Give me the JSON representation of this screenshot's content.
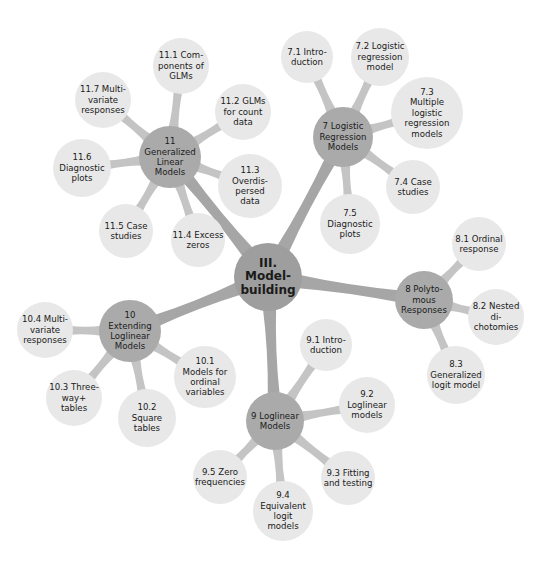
{
  "colors": {
    "background": "#ffffff",
    "root_fill": "#9e9e9e",
    "branch_fill": "#aaaaaa",
    "connector_root": "#a6a6a6",
    "connector_branch": "#c4c4c4",
    "leaf_fill": "#e8e8e8",
    "text": "#1a1a1a"
  },
  "root": {
    "id": "root",
    "label": "III.\nModel-\nbuilding",
    "x": 268,
    "y": 277,
    "r": 34
  },
  "branches": [
    {
      "id": "ch11",
      "label": "11\nGeneralized\nLinear\nModels",
      "x": 170,
      "y": 157,
      "r": 31,
      "children": [
        {
          "id": "s11_1",
          "label": "11.1 Com-\nponents of\nGLMs",
          "x": 181,
          "y": 66,
          "r": 28
        },
        {
          "id": "s11_2",
          "label": "11.2 GLMs\nfor count\ndata",
          "x": 243,
          "y": 112,
          "r": 28
        },
        {
          "id": "s11_3",
          "label": "11.3\nOverdis-\npersed\ndata",
          "x": 250,
          "y": 186,
          "r": 32
        },
        {
          "id": "s11_4",
          "label": "11.4 Excess\nzeros",
          "x": 198,
          "y": 240,
          "r": 27
        },
        {
          "id": "s11_5",
          "label": "11.5 Case\nstudies",
          "x": 126,
          "y": 231,
          "r": 27
        },
        {
          "id": "s11_6",
          "label": "11.6\nDiagnostic\nplots",
          "x": 82,
          "y": 168,
          "r": 29
        },
        {
          "id": "s11_7",
          "label": "11.7 Multi-\nvariate\nresponses",
          "x": 103,
          "y": 100,
          "r": 28
        }
      ]
    },
    {
      "id": "ch7",
      "label": "7 Logistic\nRegression\nModels",
      "x": 343,
      "y": 137,
      "r": 30,
      "children": [
        {
          "id": "s7_1",
          "label": "7.1 Intro-\nduction",
          "x": 307,
          "y": 57,
          "r": 26
        },
        {
          "id": "s7_2",
          "label": "7.2 Logistic\nregression\nmodel",
          "x": 380,
          "y": 57,
          "r": 29
        },
        {
          "id": "s7_3",
          "label": "7.3\nMultiple\nlogistic\nregression\nmodels",
          "x": 427,
          "y": 113,
          "r": 36
        },
        {
          "id": "s7_4",
          "label": "7.4 Case\nstudies",
          "x": 413,
          "y": 187,
          "r": 27
        },
        {
          "id": "s7_5",
          "label": "7.5\nDiagnostic\nplots",
          "x": 350,
          "y": 224,
          "r": 30
        }
      ]
    },
    {
      "id": "ch8",
      "label": "8 Polyto-\nmous\nResponses",
      "x": 424,
      "y": 300,
      "r": 29,
      "children": [
        {
          "id": "s8_1",
          "label": "8.1 Ordinal\nresponse",
          "x": 479,
          "y": 244,
          "r": 27
        },
        {
          "id": "s8_2",
          "label": "8.2 Nested\ndi-\nchotomies",
          "x": 496,
          "y": 317,
          "r": 28
        },
        {
          "id": "s8_3",
          "label": "8.3\nGeneralized\nlogit model",
          "x": 456,
          "y": 375,
          "r": 29
        }
      ]
    },
    {
      "id": "ch9",
      "label": "9 Loglinear\nModels",
      "x": 275,
      "y": 421,
      "r": 29,
      "children": [
        {
          "id": "s9_1",
          "label": "9.1 Intro-\nduction",
          "x": 326,
          "y": 345,
          "r": 26
        },
        {
          "id": "s9_2",
          "label": "9.2\nLoglinear\nmodels",
          "x": 367,
          "y": 405,
          "r": 28
        },
        {
          "id": "s9_3",
          "label": "9.3 Fitting\nand testing",
          "x": 348,
          "y": 478,
          "r": 27
        },
        {
          "id": "s9_4",
          "label": "9.4\nEquivalent\nlogit\nmodels",
          "x": 283,
          "y": 511,
          "r": 30
        },
        {
          "id": "s9_5",
          "label": "9.5 Zero\nfrequencies",
          "x": 220,
          "y": 477,
          "r": 27
        }
      ]
    },
    {
      "id": "ch10",
      "label": "10\nExtending\nLoglinear\nModels",
      "x": 130,
      "y": 331,
      "r": 31,
      "children": [
        {
          "id": "s10_1",
          "label": "10.1\nModels for\nordinal\nvariables",
          "x": 205,
          "y": 377,
          "r": 31
        },
        {
          "id": "s10_2",
          "label": "10.2\nSquare\ntables",
          "x": 147,
          "y": 418,
          "r": 29
        },
        {
          "id": "s10_3",
          "label": "10.3 Three-\nway+\ntables",
          "x": 74,
          "y": 398,
          "r": 28
        },
        {
          "id": "s10_4",
          "label": "10.4 Multi-\nvariate\nresponses",
          "x": 45,
          "y": 330,
          "r": 28
        }
      ]
    }
  ]
}
